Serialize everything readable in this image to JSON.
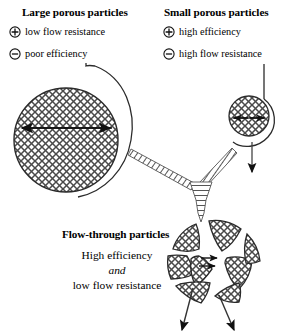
{
  "figure": {
    "type": "diagram",
    "background_color": "#ffffff",
    "ink_color": "#000000"
  },
  "groups": {
    "large": {
      "title": "Large porous particles",
      "bullets": [
        {
          "symbol": "plus-circle-icon",
          "sign": "+",
          "text": "low flow resistance"
        },
        {
          "symbol": "minus-circle-icon",
          "sign": "−",
          "text": "poor efficiency"
        }
      ]
    },
    "small": {
      "title": "Small porous particles",
      "bullets": [
        {
          "symbol": "plus-circle-icon",
          "sign": "+",
          "text": "high efficiency"
        },
        {
          "symbol": "minus-circle-icon",
          "sign": "−",
          "text": "high flow resistance"
        }
      ]
    },
    "flow_through": {
      "title": "Flow-through particles",
      "line1": "High efficiency",
      "line2": "and",
      "line3": "low flow resistance"
    }
  },
  "illustrations": {
    "large_particle": {
      "name": "large-porous-particle",
      "shape": "circle",
      "fill": "crosshatch",
      "center": [
        66,
        140
      ],
      "radius": 52,
      "diameter_arrow": "double-headed"
    },
    "small_particle": {
      "name": "small-porous-particle",
      "shape": "circle",
      "fill": "crosshatch",
      "center": [
        249,
        116
      ],
      "radius": 20,
      "diameter_arrow": "double-headed"
    },
    "flow_through_particle": {
      "name": "flow-through-particle",
      "shape": "segmented-circle",
      "fill": "crosshatch",
      "center": [
        228,
        265
      ],
      "radius": 52,
      "channels": "through-pores",
      "inlet_arrows": 1,
      "outlet_arrows": 2,
      "internal_arrows": 2
    },
    "connectors": {
      "hatched_arrows": 3,
      "description": "Two tapered hatched arrows converge and feed a downward hatched arrow into the flow-through particle"
    }
  }
}
